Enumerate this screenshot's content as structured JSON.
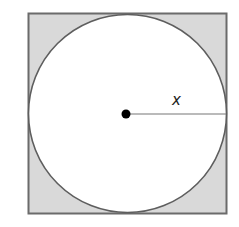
{
  "diagram": {
    "square": {
      "x": 28.5,
      "y": 13.5,
      "size": 198,
      "fill": "#d9d9d9",
      "stroke": "#6b6b6b"
    },
    "circle": {
      "cx": 127.5,
      "cy": 113.5,
      "r": 98.5,
      "fill": "#ffffff",
      "stroke": "#5e5e5e"
    },
    "center_point": {
      "cx": 126,
      "cy": 114,
      "r": 5,
      "fill": "#000000"
    },
    "radius_line": {
      "x1": 126,
      "y1": 114,
      "x2": 226,
      "y2": 114,
      "stroke": "#666666"
    },
    "radius_label": "x"
  }
}
